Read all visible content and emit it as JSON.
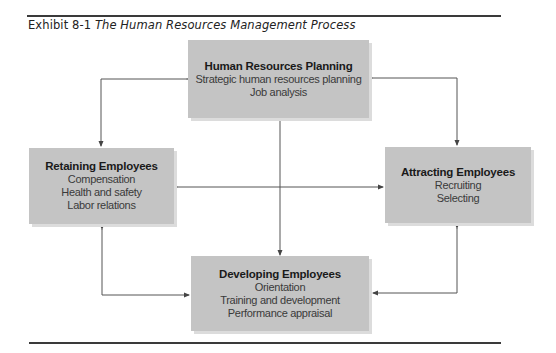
{
  "caption": {
    "label": "Exhibit 8-1",
    "title": "The Human Resources Management Process"
  },
  "boxes": {
    "planning": {
      "heading": "Human Resources Planning",
      "items": [
        "Strategic human resources planning",
        "Job analysis"
      ]
    },
    "retaining": {
      "heading": "Retaining Employees",
      "items": [
        "Compensation",
        "Health and safety",
        "Labor relations"
      ]
    },
    "attracting": {
      "heading": "Attracting Employees",
      "items": [
        "Recruiting",
        "Selecting"
      ]
    },
    "developing": {
      "heading": "Developing Employees",
      "items": [
        "Orientation",
        "Training and development",
        "Performance appraisal"
      ]
    }
  },
  "colors": {
    "box_fill": "#c4c4c4",
    "box_shadow": "#dcdcdc",
    "connector": "#555555",
    "rule": "#3a3a3a"
  },
  "connections": [
    {
      "from": "planning",
      "to": "retaining",
      "direction": "bidirectional"
    },
    {
      "from": "planning",
      "to": "attracting",
      "direction": "bidirectional"
    },
    {
      "from": "planning",
      "to": "developing",
      "direction": "bidirectional"
    },
    {
      "from": "retaining",
      "to": "attracting",
      "direction": "bidirectional"
    },
    {
      "from": "retaining",
      "to": "developing",
      "direction": "bidirectional"
    },
    {
      "from": "attracting",
      "to": "developing",
      "direction": "bidirectional"
    }
  ]
}
